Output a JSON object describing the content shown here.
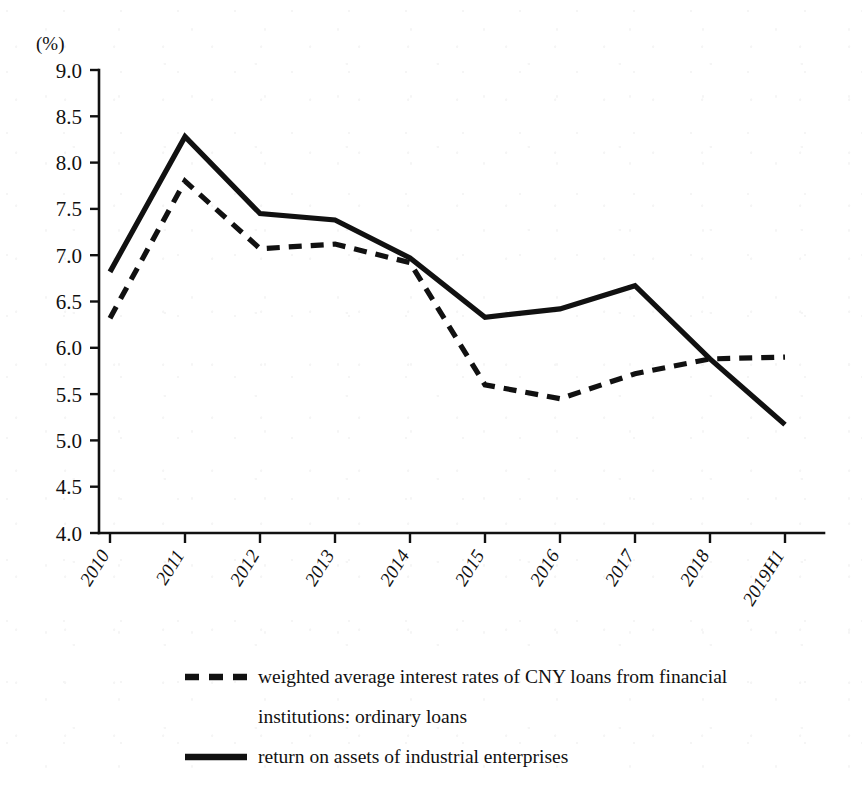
{
  "chart_data": {
    "type": "line",
    "title": "",
    "xlabel": "",
    "ylabel": "(%)",
    "unit_label": "(%)",
    "categories": [
      "2010",
      "2011",
      "2012",
      "2013",
      "2014",
      "2015",
      "2016",
      "2017",
      "2018",
      "2019H1"
    ],
    "ylim": [
      4.0,
      9.0
    ],
    "y_ticks": [
      "4.0",
      "4.5",
      "5.0",
      "5.5",
      "6.0",
      "6.5",
      "7.0",
      "7.5",
      "8.0",
      "8.5",
      "9.0"
    ],
    "y_tick_values": [
      4.0,
      4.5,
      5.0,
      5.5,
      6.0,
      6.5,
      7.0,
      7.5,
      8.0,
      8.5,
      9.0
    ],
    "grid": false,
    "legend_position": "bottom",
    "series": [
      {
        "name": "weighted average interest rates of CNY loans from financial institutions: ordinary loans",
        "style": "dashed",
        "color": "#111111",
        "values": [
          6.32,
          7.8,
          7.07,
          7.12,
          6.92,
          5.6,
          5.45,
          5.72,
          5.88,
          5.9
        ]
      },
      {
        "name": "return on assets of industrial enterprises",
        "style": "solid",
        "color": "#111111",
        "values": [
          6.82,
          8.28,
          7.45,
          7.38,
          6.97,
          6.33,
          6.42,
          6.67,
          5.88,
          5.17
        ]
      }
    ]
  },
  "legend": {
    "entries": [
      {
        "label_line1": "weighted average interest rates of CNY loans from financial",
        "label_line2": "institutions: ordinary loans",
        "style": "dashed"
      },
      {
        "label_line1": "return on assets of industrial enterprises",
        "label_line2": "",
        "style": "solid"
      }
    ]
  }
}
